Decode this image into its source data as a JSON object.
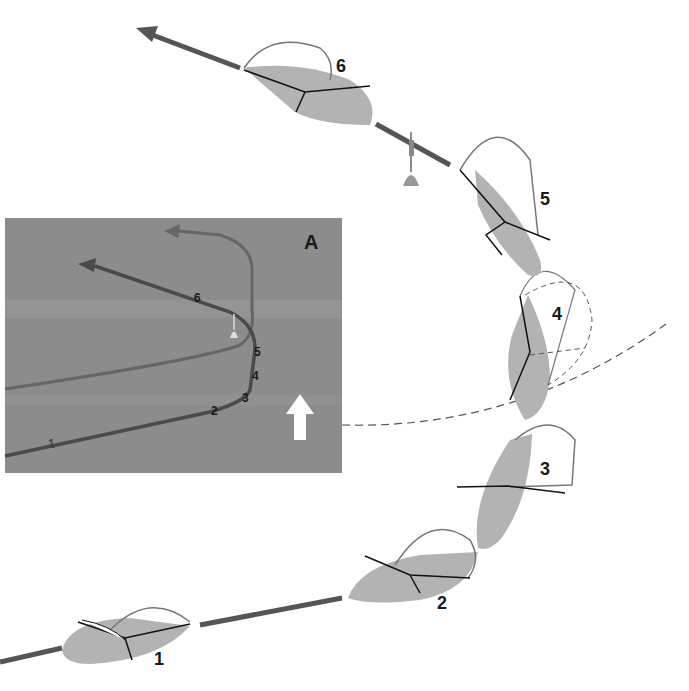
{
  "diagram": {
    "type": "sailing-manoeuvre",
    "inset": {
      "label": "A",
      "position_labels": [
        "1",
        "2",
        "3",
        "4",
        "5",
        "6"
      ],
      "wind_arrow": "up",
      "background": "#8a8a8a",
      "track_color": "#4a4a4a",
      "alt_track_color": "#666666"
    },
    "boats": [
      {
        "id": "1",
        "label": "1"
      },
      {
        "id": "2",
        "label": "2"
      },
      {
        "id": "3",
        "label": "3"
      },
      {
        "id": "4",
        "label": "4"
      },
      {
        "id": "5",
        "label": "5"
      },
      {
        "id": "6",
        "label": "6"
      }
    ],
    "colors": {
      "hull": "#b5b5b5",
      "track": "#505050",
      "outline": "#111111",
      "background": "#ffffff"
    }
  }
}
